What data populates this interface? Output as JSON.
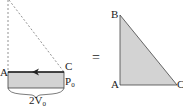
{
  "diagram": {
    "left_figure": {
      "labels": {
        "A": "A",
        "C": "C",
        "P": "P",
        "P_sub": "0",
        "V_coef": "2V",
        "V_sub": "0"
      },
      "fill_color": "#d3d3d3",
      "stroke_color": "#333333",
      "arrow_direction": "left"
    },
    "equals_sign": "=",
    "right_figure": {
      "labels": {
        "A": "A",
        "B": "B",
        "C": "C"
      },
      "fill_color": "#d3d3d3",
      "stroke_color": "#333333"
    }
  }
}
